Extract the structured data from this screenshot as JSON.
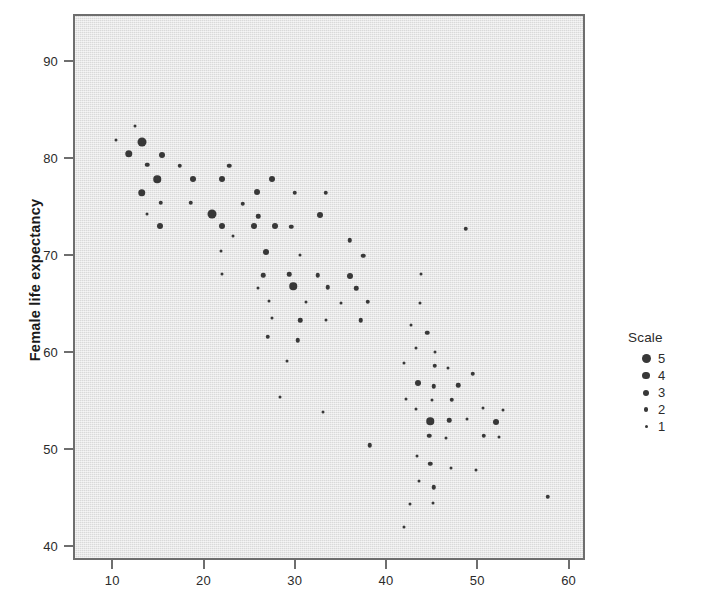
{
  "chart_data": {
    "type": "scatter",
    "title": "",
    "xlabel": "",
    "ylabel": "Female life expectancy",
    "xlim": [
      5.7,
      61.8
    ],
    "ylim": [
      38.6,
      94.8
    ],
    "xticks": [
      10,
      20,
      30,
      40,
      50,
      60
    ],
    "yticks": [
      40,
      50,
      60,
      70,
      80,
      90
    ],
    "grid": false,
    "size_encoding": {
      "legend_title": "Scale",
      "levels": [
        5,
        4,
        3,
        2,
        1
      ],
      "legend_position": "right"
    },
    "points": [
      {
        "x": 10.2,
        "y": 82.0,
        "scale": 1
      },
      {
        "x": 12.3,
        "y": 83.5,
        "scale": 1
      },
      {
        "x": 13.0,
        "y": 81.8,
        "scale": 5
      },
      {
        "x": 11.6,
        "y": 80.6,
        "scale": 4
      },
      {
        "x": 15.2,
        "y": 80.5,
        "scale": 3
      },
      {
        "x": 13.6,
        "y": 79.5,
        "scale": 2
      },
      {
        "x": 17.2,
        "y": 79.4,
        "scale": 2
      },
      {
        "x": 22.6,
        "y": 79.4,
        "scale": 2
      },
      {
        "x": 14.7,
        "y": 78.0,
        "scale": 4
      },
      {
        "x": 18.6,
        "y": 78.0,
        "scale": 3
      },
      {
        "x": 21.8,
        "y": 78.0,
        "scale": 3
      },
      {
        "x": 27.3,
        "y": 78.0,
        "scale": 3
      },
      {
        "x": 13.0,
        "y": 76.6,
        "scale": 4
      },
      {
        "x": 25.6,
        "y": 76.7,
        "scale": 3
      },
      {
        "x": 29.8,
        "y": 76.6,
        "scale": 2
      },
      {
        "x": 33.2,
        "y": 76.6,
        "scale": 2
      },
      {
        "x": 15.1,
        "y": 75.6,
        "scale": 2
      },
      {
        "x": 18.4,
        "y": 75.6,
        "scale": 2
      },
      {
        "x": 24.1,
        "y": 75.5,
        "scale": 2
      },
      {
        "x": 13.6,
        "y": 74.4,
        "scale": 1
      },
      {
        "x": 20.7,
        "y": 74.4,
        "scale": 5
      },
      {
        "x": 25.8,
        "y": 74.2,
        "scale": 2
      },
      {
        "x": 32.5,
        "y": 74.3,
        "scale": 3
      },
      {
        "x": 15.0,
        "y": 73.2,
        "scale": 3
      },
      {
        "x": 21.8,
        "y": 73.2,
        "scale": 3
      },
      {
        "x": 25.3,
        "y": 73.2,
        "scale": 3
      },
      {
        "x": 27.6,
        "y": 73.2,
        "scale": 3
      },
      {
        "x": 23.0,
        "y": 72.2,
        "scale": 1
      },
      {
        "x": 29.4,
        "y": 73.1,
        "scale": 2
      },
      {
        "x": 35.8,
        "y": 71.7,
        "scale": 2
      },
      {
        "x": 21.7,
        "y": 70.6,
        "scale": 1
      },
      {
        "x": 26.6,
        "y": 70.5,
        "scale": 3
      },
      {
        "x": 30.3,
        "y": 70.2,
        "scale": 1
      },
      {
        "x": 37.3,
        "y": 70.1,
        "scale": 2
      },
      {
        "x": 21.8,
        "y": 68.2,
        "scale": 1
      },
      {
        "x": 26.3,
        "y": 68.1,
        "scale": 2
      },
      {
        "x": 29.2,
        "y": 68.2,
        "scale": 2
      },
      {
        "x": 32.3,
        "y": 68.1,
        "scale": 2
      },
      {
        "x": 35.8,
        "y": 68.0,
        "scale": 3
      },
      {
        "x": 43.6,
        "y": 68.2,
        "scale": 1
      },
      {
        "x": 25.7,
        "y": 66.8,
        "scale": 1
      },
      {
        "x": 29.6,
        "y": 67.0,
        "scale": 4
      },
      {
        "x": 33.4,
        "y": 66.9,
        "scale": 2
      },
      {
        "x": 36.5,
        "y": 66.8,
        "scale": 2
      },
      {
        "x": 27.0,
        "y": 65.5,
        "scale": 1
      },
      {
        "x": 31.0,
        "y": 65.4,
        "scale": 1
      },
      {
        "x": 34.9,
        "y": 65.3,
        "scale": 1
      },
      {
        "x": 37.8,
        "y": 65.4,
        "scale": 2
      },
      {
        "x": 43.5,
        "y": 65.3,
        "scale": 1
      },
      {
        "x": 27.3,
        "y": 63.7,
        "scale": 1
      },
      {
        "x": 30.4,
        "y": 63.5,
        "scale": 2
      },
      {
        "x": 33.2,
        "y": 63.5,
        "scale": 1
      },
      {
        "x": 37.0,
        "y": 63.5,
        "scale": 2
      },
      {
        "x": 42.5,
        "y": 63.0,
        "scale": 1
      },
      {
        "x": 26.8,
        "y": 61.8,
        "scale": 2
      },
      {
        "x": 30.1,
        "y": 61.4,
        "scale": 2
      },
      {
        "x": 44.3,
        "y": 62.2,
        "scale": 2
      },
      {
        "x": 43.1,
        "y": 60.6,
        "scale": 1
      },
      {
        "x": 45.2,
        "y": 60.2,
        "scale": 1
      },
      {
        "x": 28.9,
        "y": 59.3,
        "scale": 1
      },
      {
        "x": 41.8,
        "y": 59.1,
        "scale": 1
      },
      {
        "x": 45.1,
        "y": 58.8,
        "scale": 2
      },
      {
        "x": 46.6,
        "y": 58.6,
        "scale": 1
      },
      {
        "x": 49.3,
        "y": 58.0,
        "scale": 2
      },
      {
        "x": 28.2,
        "y": 55.6,
        "scale": 1
      },
      {
        "x": 43.3,
        "y": 57.0,
        "scale": 3
      },
      {
        "x": 45.0,
        "y": 56.7,
        "scale": 2
      },
      {
        "x": 47.7,
        "y": 56.8,
        "scale": 2
      },
      {
        "x": 42.0,
        "y": 55.4,
        "scale": 1
      },
      {
        "x": 44.8,
        "y": 55.3,
        "scale": 1
      },
      {
        "x": 47.0,
        "y": 55.3,
        "scale": 2
      },
      {
        "x": 50.4,
        "y": 54.4,
        "scale": 1
      },
      {
        "x": 52.6,
        "y": 54.2,
        "scale": 1
      },
      {
        "x": 32.9,
        "y": 54.0,
        "scale": 1
      },
      {
        "x": 43.1,
        "y": 54.3,
        "scale": 1
      },
      {
        "x": 44.6,
        "y": 53.1,
        "scale": 4
      },
      {
        "x": 46.7,
        "y": 53.2,
        "scale": 2
      },
      {
        "x": 48.6,
        "y": 53.3,
        "scale": 1
      },
      {
        "x": 51.8,
        "y": 53.0,
        "scale": 3
      },
      {
        "x": 38.0,
        "y": 50.6,
        "scale": 2
      },
      {
        "x": 44.5,
        "y": 51.6,
        "scale": 2
      },
      {
        "x": 46.4,
        "y": 51.4,
        "scale": 1
      },
      {
        "x": 50.5,
        "y": 51.6,
        "scale": 2
      },
      {
        "x": 52.2,
        "y": 51.5,
        "scale": 1
      },
      {
        "x": 43.2,
        "y": 49.5,
        "scale": 1
      },
      {
        "x": 44.6,
        "y": 48.7,
        "scale": 2
      },
      {
        "x": 46.9,
        "y": 48.3,
        "scale": 1
      },
      {
        "x": 49.6,
        "y": 48.1,
        "scale": 1
      },
      {
        "x": 43.4,
        "y": 46.9,
        "scale": 1
      },
      {
        "x": 45.0,
        "y": 46.3,
        "scale": 2
      },
      {
        "x": 44.9,
        "y": 44.7,
        "scale": 1
      },
      {
        "x": 42.4,
        "y": 44.6,
        "scale": 1
      },
      {
        "x": 57.5,
        "y": 45.3,
        "scale": 2
      },
      {
        "x": 41.8,
        "y": 42.2,
        "scale": 1
      },
      {
        "x": 48.5,
        "y": 72.9,
        "scale": 2
      }
    ]
  },
  "axes": {
    "y_title": "Female life expectancy",
    "x_tick_labels": [
      "10",
      "20",
      "30",
      "40",
      "50",
      "60"
    ],
    "y_tick_labels": [
      "90",
      "80",
      "70",
      "60",
      "50",
      "40"
    ]
  },
  "legend": {
    "title": "Scale",
    "items": [
      {
        "label": "5",
        "dot_px": 9
      },
      {
        "label": "4",
        "dot_px": 7.5
      },
      {
        "label": "3",
        "dot_px": 6
      },
      {
        "label": "2",
        "dot_px": 4.5
      },
      {
        "label": "1",
        "dot_px": 3
      }
    ]
  },
  "style": {
    "plot_background": "#d9d9d9",
    "plot_border": "#6e6e6e",
    "marker_color": "#383838",
    "text_color": "#2b2b2b"
  }
}
